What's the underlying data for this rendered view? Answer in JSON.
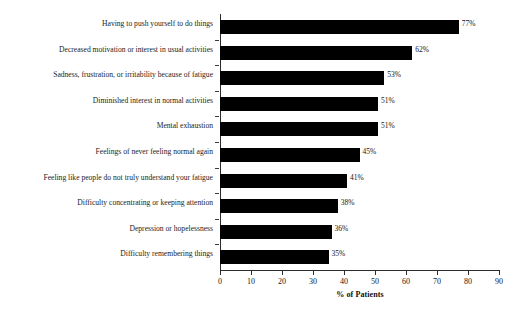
{
  "chart_data": {
    "type": "bar",
    "orientation": "horizontal",
    "title": "",
    "xlabel": "% of Patients",
    "ylabel": "",
    "xlim": [
      0,
      90
    ],
    "xticks": [
      0,
      10,
      20,
      30,
      40,
      50,
      60,
      70,
      80,
      90
    ],
    "grid": false,
    "legend": null,
    "bar_color": "#000000",
    "categories": [
      "Having to push yourself to do things",
      "Decreased motivation or interest in usual activities",
      "Sadness, frustration, or irritability because of fatigue",
      "Diminished interest in normal activities",
      "Mental exhaustion",
      "Feelings of never feeling normal again",
      "Feeling like people do not truly understand your fatigue",
      "Difficulty concentrating or keeping attention",
      "Depression or hopelessness",
      "Difficulty remembering things"
    ],
    "values": [
      77,
      62,
      53,
      51,
      51,
      45,
      41,
      38,
      36,
      35
    ],
    "data_labels": [
      "77%",
      "62%",
      "53%",
      "51%",
      "51%",
      "45%",
      "41%",
      "38%",
      "36%",
      "35%"
    ]
  }
}
